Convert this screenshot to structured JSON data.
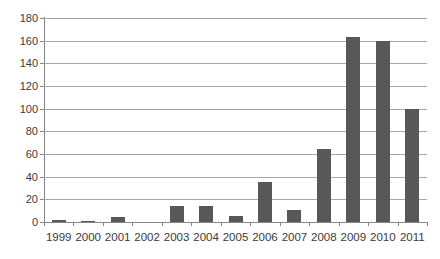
{
  "chart_data": {
    "type": "bar",
    "title": "",
    "subtitle": "",
    "xlabel": "",
    "ylabel": "",
    "categories": [
      "1999",
      "2000",
      "2001",
      "2002",
      "2003",
      "2004",
      "2005",
      "2006",
      "2007",
      "2008",
      "2009",
      "2010",
      "2011"
    ],
    "values": [
      2,
      1,
      4,
      0,
      14,
      14,
      5,
      35,
      11,
      64,
      163,
      160,
      100
    ],
    "series": [
      {
        "name": "",
        "values": [
          2,
          1,
          4,
          0,
          14,
          14,
          5,
          35,
          11,
          64,
          163,
          160,
          100
        ]
      }
    ],
    "ylim": [
      0,
      180
    ],
    "ytick_step": 20,
    "yticks": [
      "180",
      "160",
      "140",
      "120",
      "100",
      "80",
      "60",
      "40",
      "20",
      "0"
    ],
    "ytick_values": [
      180,
      160,
      140,
      120,
      100,
      80,
      60,
      40,
      20,
      0
    ],
    "grid": true,
    "grid_axis": "y",
    "legend": false,
    "legend_position": "none",
    "bar_color": "#58585a",
    "gridline_color": "#a6a6a6",
    "axis_color": "#868686",
    "background_color": "#ffffff",
    "text_color": "#3a3a3a"
  }
}
